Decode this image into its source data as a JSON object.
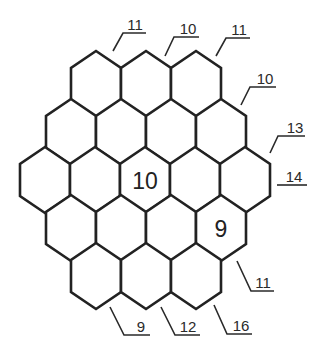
{
  "puzzle": {
    "type": "hexagonal-sum-grid",
    "rows": [
      {
        "cells": [
          "",
          "",
          ""
        ]
      },
      {
        "cells": [
          "",
          "",
          "",
          ""
        ]
      },
      {
        "cells": [
          "",
          "",
          "10",
          "",
          ""
        ]
      },
      {
        "cells": [
          "",
          "",
          "",
          "9"
        ]
      },
      {
        "cells": [
          "",
          "",
          ""
        ]
      }
    ],
    "clues": [
      {
        "id": "top-1",
        "value": "11",
        "position": "top"
      },
      {
        "id": "top-2",
        "value": "10",
        "position": "top"
      },
      {
        "id": "top-3",
        "value": "11",
        "position": "top"
      },
      {
        "id": "right-1",
        "value": "10",
        "position": "upper-right"
      },
      {
        "id": "right-2",
        "value": "13",
        "position": "upper-right"
      },
      {
        "id": "right-3",
        "value": "14",
        "position": "right"
      },
      {
        "id": "bottom-right-1",
        "value": "11",
        "position": "lower-right"
      },
      {
        "id": "bottom-1",
        "value": "16",
        "position": "bottom"
      },
      {
        "id": "bottom-2",
        "value": "12",
        "position": "bottom"
      },
      {
        "id": "bottom-3",
        "value": "9",
        "position": "bottom"
      }
    ]
  },
  "colors": {
    "stroke": "#222222",
    "text": "#222222",
    "background": "#ffffff"
  }
}
